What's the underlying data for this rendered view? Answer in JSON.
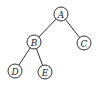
{
  "diagram": {
    "type": "binary-tree",
    "nodes": [
      {
        "id": "A",
        "label": "A"
      },
      {
        "id": "B",
        "label": "B"
      },
      {
        "id": "C",
        "label": "C"
      },
      {
        "id": "D",
        "label": "D"
      },
      {
        "id": "E",
        "label": "E"
      }
    ],
    "edges": [
      {
        "from": "A",
        "to": "B"
      },
      {
        "from": "A",
        "to": "C"
      },
      {
        "from": "B",
        "to": "D"
      },
      {
        "from": "B",
        "to": "E"
      }
    ]
  }
}
